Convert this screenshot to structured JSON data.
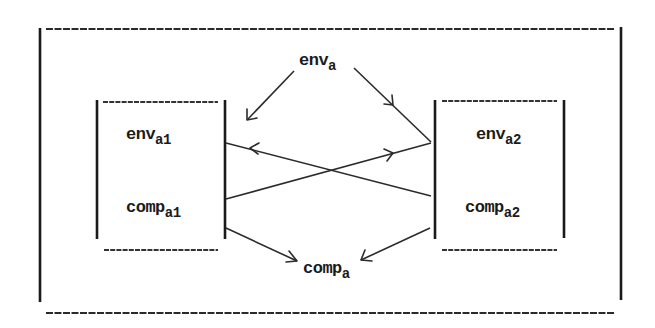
{
  "diagram": {
    "title": "",
    "colors": {
      "ink": "#1a1a1a",
      "background": "#ffffff"
    },
    "nodes": {
      "env_a": {
        "base": "env",
        "sub": "a"
      },
      "comp_a": {
        "base": "comp",
        "sub": "a"
      },
      "env_a1": {
        "base": "env",
        "sub": "a1"
      },
      "comp_a1": {
        "base": "comp",
        "sub": "a1"
      },
      "env_a2": {
        "base": "env",
        "sub": "a2"
      },
      "comp_a2": {
        "base": "comp",
        "sub": "a2"
      }
    },
    "containers": [
      {
        "id": "outer-frame",
        "contains": [
          "env_a",
          "comp_a",
          "component-a1",
          "component-a2"
        ]
      },
      {
        "id": "component-a1",
        "contains": [
          "env_a1",
          "comp_a1"
        ]
      },
      {
        "id": "component-a2",
        "contains": [
          "env_a2",
          "comp_a2"
        ]
      }
    ],
    "edges": [
      {
        "from": "env_a",
        "to": "component-a1"
      },
      {
        "from": "env_a",
        "to": "component-a2"
      },
      {
        "from": "comp_a1",
        "to": "component-a2"
      },
      {
        "from": "comp_a2",
        "to": "component-a1"
      },
      {
        "from": "component-a1",
        "to": "comp_a"
      },
      {
        "from": "component-a2",
        "to": "comp_a"
      }
    ]
  }
}
